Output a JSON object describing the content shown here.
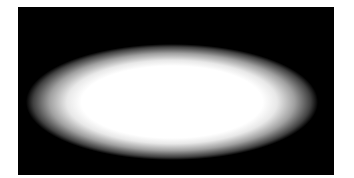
{
  "image": {
    "description": "Blurred white ellipse on black rectangular background",
    "background_color": "#000000",
    "shape_color": "#ffffff",
    "page_color": "#ffffff"
  }
}
